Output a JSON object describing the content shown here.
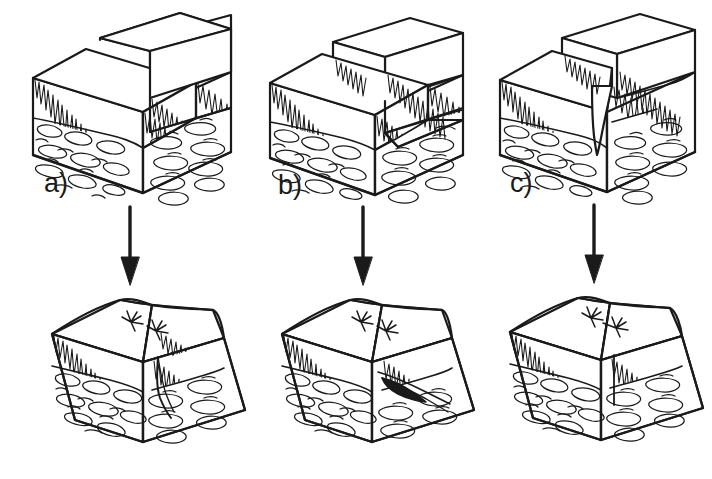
{
  "figure": {
    "type": "geological-block-diagram",
    "background_color": "#ffffff",
    "line_color": "#1a1a1a",
    "fill_color": "#ffffff",
    "layout": "2 rows x 3 columns"
  },
  "labels": {
    "a": "a)",
    "b": "b)",
    "c": "c)"
  },
  "columns": [
    {
      "id": "a",
      "label": "a)",
      "top": {
        "name": "vertical-walled-fissure-block",
        "feature": "vertical open fissure between two offset blocks"
      },
      "arrow": {
        "name": "down-arrow",
        "direction": "down"
      },
      "bottom": {
        "name": "settled-block-vertical-fissure",
        "feature": "eroded trapezoidal block with narrow vertical crack and surface vegetation"
      }
    },
    {
      "id": "b",
      "label": "b)",
      "top": {
        "name": "inclined-fault-plane-block",
        "feature": "inclined (dipping) fault plane with hanging wall overlap"
      },
      "arrow": {
        "name": "down-arrow",
        "direction": "down"
      },
      "bottom": {
        "name": "settled-block-inclined-fault",
        "feature": "eroded trapezoidal block with wedge-shaped dark void and surface vegetation"
      }
    },
    {
      "id": "c",
      "label": "c)",
      "top": {
        "name": "v-shaped-fissure-block",
        "feature": "narrow V-shaped tapering fissure penetrating the soil into bedrock"
      },
      "arrow": {
        "name": "down-arrow",
        "direction": "down"
      },
      "bottom": {
        "name": "settled-block-v-fissure",
        "feature": "eroded trapezoidal block with hairline vertical crack and surface vegetation"
      }
    }
  ],
  "strata": [
    {
      "name": "soil-layer",
      "pattern": "drip / stalactite hachure"
    },
    {
      "name": "bedrock-layer",
      "pattern": "cobble / pebble conglomerate"
    }
  ],
  "symbols": [
    {
      "name": "vegetation-tuft",
      "count_per_bottom_panel": 2
    }
  ]
}
